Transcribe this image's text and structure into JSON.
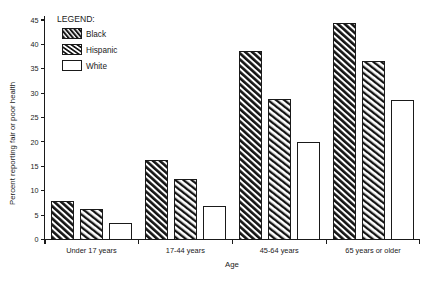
{
  "chart_data": {
    "type": "bar",
    "title": "",
    "xlabel": "Age",
    "ylabel": "Percent reporting fair or poor health",
    "categories": [
      "Under 17 years",
      "17-44 years",
      "45-64 years",
      "65 years or older"
    ],
    "series": [
      {
        "name": "Black",
        "fill": "dense-diagonal-hatch",
        "values": [
          7.7,
          16.1,
          38.6,
          44.2
        ]
      },
      {
        "name": "Hispanic",
        "fill": "diagonal-hatch",
        "values": [
          6.1,
          12.2,
          28.6,
          36.5
        ]
      },
      {
        "name": "White",
        "fill": "none",
        "values": [
          3.3,
          6.8,
          19.8,
          28.4
        ]
      }
    ],
    "ylim": [
      0,
      45
    ],
    "yticks": [
      0,
      5,
      10,
      15,
      20,
      25,
      30,
      35,
      40,
      45
    ],
    "ytick_labels": [
      "0",
      "5",
      "10",
      "15",
      "20",
      "25",
      "30",
      "35",
      "40",
      "45"
    ],
    "grid": false,
    "legend_position": "top-left"
  },
  "legend": {
    "title": "LEGEND:",
    "entries": [
      {
        "label": "Black"
      },
      {
        "label": "Hispanic"
      },
      {
        "label": "White"
      }
    ]
  },
  "colors": {
    "ink": "#1a1a1a",
    "background": "#ffffff",
    "bar_fill_empty": "#ffffff"
  }
}
